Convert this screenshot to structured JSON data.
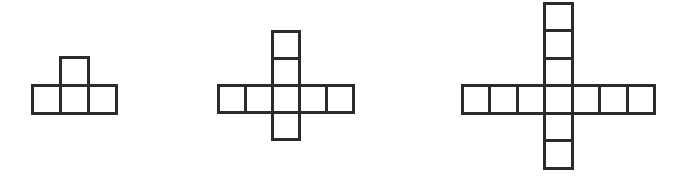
{
  "canvas": {
    "width": 694,
    "height": 180,
    "background_color": "#ffffff",
    "stroke_color": "#2b2b2b",
    "stroke_width": 3
  },
  "figures": [
    {
      "name": "figure-1-tee",
      "shape_label": "T-shape",
      "square_count": 4,
      "cell_size": 28,
      "origin_x": 32,
      "origin_y": 57,
      "cells": [
        {
          "col": 1,
          "row": 0
        },
        {
          "col": 0,
          "row": 1
        },
        {
          "col": 1,
          "row": 1
        },
        {
          "col": 2,
          "row": 1
        }
      ]
    },
    {
      "name": "figure-2-cross-small",
      "shape_label": "cross",
      "square_count": 8,
      "cell_size": 27,
      "origin_x": 218,
      "origin_y": 31,
      "cells": [
        {
          "col": 2,
          "row": 0
        },
        {
          "col": 2,
          "row": 1
        },
        {
          "col": 0,
          "row": 2
        },
        {
          "col": 1,
          "row": 2
        },
        {
          "col": 2,
          "row": 2
        },
        {
          "col": 3,
          "row": 2
        },
        {
          "col": 4,
          "row": 2
        },
        {
          "col": 2,
          "row": 3
        }
      ]
    },
    {
      "name": "figure-3-cross-large",
      "shape_label": "cross",
      "square_count": 12,
      "cell_size": 27.5,
      "origin_x": 462,
      "origin_y": 3,
      "cells": [
        {
          "col": 3,
          "row": 0
        },
        {
          "col": 3,
          "row": 1
        },
        {
          "col": 3,
          "row": 2
        },
        {
          "col": 0,
          "row": 3
        },
        {
          "col": 1,
          "row": 3
        },
        {
          "col": 2,
          "row": 3
        },
        {
          "col": 3,
          "row": 3
        },
        {
          "col": 4,
          "row": 3
        },
        {
          "col": 5,
          "row": 3
        },
        {
          "col": 6,
          "row": 3
        },
        {
          "col": 3,
          "row": 4
        },
        {
          "col": 3,
          "row": 5
        }
      ]
    }
  ]
}
